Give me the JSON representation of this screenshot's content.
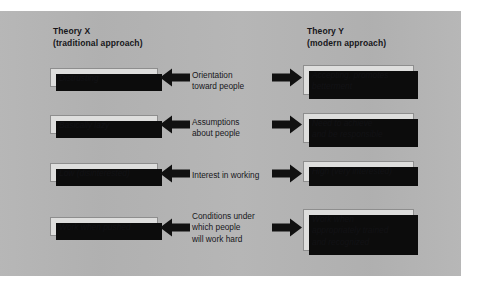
{
  "figure": {
    "background_color": "#b3b3b3",
    "page_color": "#ffffff",
    "box_fill": "#dededd",
    "shadow_color": "#0c0c0c",
    "arrow_color": "#111111"
  },
  "columns": {
    "left": {
      "heading": "Theory X\n(traditional approach)",
      "items": [
        "Distrusting",
        "Basically lazy",
        "Low (disinterested)",
        "Work when pushed"
      ]
    },
    "middle": {
      "labels": [
        "Orientation\ntoward people",
        "Assumptions\nabout people",
        "Interest in working",
        "Conditions under\nwhich people\nwill work hard"
      ]
    },
    "right": {
      "heading": "Theory Y\n(modern approach)",
      "items": [
        "Accepting, promotes\nbetterment",
        "Need to achieve\nand be responsible",
        "High (very interested)",
        "Work when\nappropriately trained\nand recognized"
      ]
    }
  },
  "icons": {
    "arrow_left": "arrow-left-icon",
    "arrow_right": "arrow-right-icon"
  }
}
